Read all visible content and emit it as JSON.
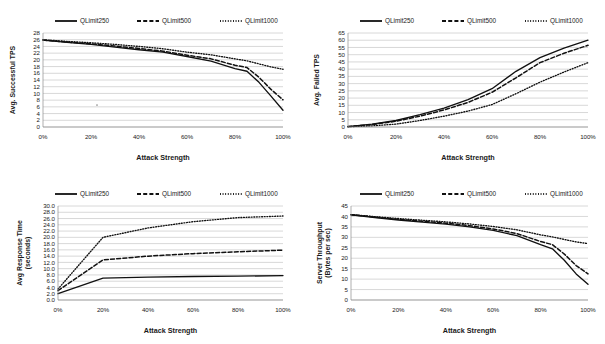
{
  "figure": {
    "top_text_fragment": "",
    "legend": {
      "entries": [
        {
          "label": "QLimit250",
          "style": "solid"
        },
        {
          "label": "QLimit500",
          "style": "dashed"
        },
        {
          "label": "QLimit1000",
          "style": "dotted"
        }
      ]
    },
    "shared_xlabel": "Attack Strength",
    "shared_xticks": [
      "0%",
      "20%",
      "40%",
      "60%",
      "80%",
      "100%"
    ]
  },
  "chart_data": [
    {
      "id": "avg-successful-tps",
      "position": "top-left",
      "type": "line",
      "title": "",
      "xlabel": "Attack Strength",
      "ylabel": "Avg. Successful TPS",
      "x": [
        0,
        10,
        20,
        30,
        40,
        50,
        60,
        70,
        80,
        85,
        90,
        95,
        100
      ],
      "xticks": [
        "0%",
        "20%",
        "40%",
        "60%",
        "80%",
        "100%"
      ],
      "xtick_values": [
        0,
        20,
        40,
        60,
        80,
        100
      ],
      "xlim": [
        0,
        100
      ],
      "ylim": [
        0,
        28
      ],
      "yticks": [
        0,
        2,
        4,
        6,
        8,
        10,
        12,
        14,
        16,
        18,
        20,
        22,
        24,
        26,
        28
      ],
      "ytick_labels": [
        "0",
        "2",
        "4",
        "6",
        "8",
        "10",
        "12",
        "14",
        "16",
        "18",
        "20",
        "22",
        "24",
        "26",
        "28"
      ],
      "grid": true,
      "legend_position": "top-center",
      "series": [
        {
          "name": "QLimit250",
          "style": "solid",
          "values": [
            25.9,
            25.2,
            24.6,
            23.8,
            23.0,
            22.3,
            21.0,
            19.6,
            17.4,
            16.6,
            13.3,
            9.2,
            5.0
          ]
        },
        {
          "name": "QLimit500",
          "style": "dashed",
          "values": [
            25.9,
            25.3,
            24.8,
            24.1,
            23.4,
            22.6,
            21.4,
            20.3,
            18.4,
            17.7,
            14.8,
            11.2,
            8.1
          ]
        },
        {
          "name": "QLimit1000",
          "style": "dotted",
          "values": [
            26.0,
            25.5,
            25.1,
            24.6,
            24.0,
            23.3,
            22.3,
            21.5,
            20.3,
            19.7,
            18.8,
            17.9,
            17.2
          ]
        }
      ]
    },
    {
      "id": "avg-failed-tps",
      "position": "top-right",
      "type": "line",
      "title": "",
      "xlabel": "Attack Strength",
      "ylabel": "Avg. Failed TPS",
      "x": [
        0,
        10,
        20,
        30,
        40,
        50,
        60,
        70,
        80,
        90,
        100
      ],
      "xticks": [
        "0%",
        "20%",
        "40%",
        "60%",
        "80%",
        "100%"
      ],
      "xtick_values": [
        0,
        20,
        40,
        60,
        80,
        100
      ],
      "xlim": [
        0,
        100
      ],
      "ylim": [
        0,
        65
      ],
      "yticks": [
        0,
        5,
        10,
        15,
        20,
        25,
        30,
        35,
        40,
        45,
        50,
        55,
        60,
        65
      ],
      "ytick_labels": [
        "0",
        "5",
        "10",
        "15",
        "20",
        "25",
        "30",
        "35",
        "40",
        "45",
        "50",
        "55",
        "60",
        "65"
      ],
      "grid": true,
      "legend_position": "top-center",
      "series": [
        {
          "name": "QLimit250",
          "style": "solid",
          "values": [
            0.3,
            2.0,
            4.5,
            8.5,
            13.0,
            19.0,
            26.5,
            38.5,
            48.0,
            54.5,
            60.0
          ]
        },
        {
          "name": "QLimit500",
          "style": "dashed",
          "values": [
            0.3,
            1.7,
            4.0,
            7.5,
            11.8,
            17.0,
            24.0,
            34.0,
            44.5,
            51.0,
            56.5
          ]
        },
        {
          "name": "QLimit1000",
          "style": "dotted",
          "values": [
            0.2,
            0.8,
            2.0,
            4.5,
            7.5,
            11.0,
            15.5,
            23.0,
            31.0,
            38.0,
            44.5
          ]
        }
      ]
    },
    {
      "id": "avg-response-time",
      "position": "bottom-left",
      "type": "line",
      "title": "",
      "xlabel": "Attack Strength",
      "ylabel": "Avg Response Time (seconds)",
      "ylabel_line1": "Avg Response Time",
      "ylabel_line2": "(seconds)",
      "x": [
        0,
        20,
        40,
        60,
        80,
        100
      ],
      "xticks": [
        "0%",
        "20%",
        "40%",
        "60%",
        "80%",
        "100%"
      ],
      "xtick_values": [
        0,
        20,
        40,
        60,
        80,
        100
      ],
      "xlim": [
        0,
        100
      ],
      "ylim": [
        0,
        30
      ],
      "yticks": [
        0,
        2,
        4,
        6,
        8,
        10,
        12,
        14,
        16,
        18,
        20,
        22,
        24,
        26,
        28,
        30
      ],
      "ytick_labels": [
        "0.0",
        "2.0",
        "4.0",
        "6.0",
        "8.0",
        "10.0",
        "12.0",
        "14.0",
        "16.0",
        "18.0",
        "20.0",
        "22.0",
        "24.0",
        "26.0",
        "28.0",
        "30.0"
      ],
      "grid": true,
      "legend_position": "top-center",
      "series": [
        {
          "name": "QLimit250",
          "style": "solid",
          "values": [
            2.0,
            7.0,
            7.3,
            7.5,
            7.6,
            7.8
          ]
        },
        {
          "name": "QLimit500",
          "style": "dashed",
          "values": [
            3.0,
            12.8,
            14.0,
            14.8,
            15.4,
            15.9
          ]
        },
        {
          "name": "QLimit1000",
          "style": "dotted",
          "values": [
            3.5,
            20.0,
            23.0,
            25.0,
            26.3,
            26.8
          ]
        }
      ]
    },
    {
      "id": "server-throughput",
      "position": "bottom-right",
      "type": "line",
      "title": "",
      "xlabel": "Attack Strength",
      "ylabel": "Server Throughput (Bytes per sec)",
      "ylabel_line1": "Server Throughput",
      "ylabel_line2": "(Bytes per sec)",
      "x": [
        0,
        10,
        20,
        30,
        40,
        50,
        60,
        70,
        80,
        85,
        90,
        95,
        100
      ],
      "xticks": [
        "0%",
        "20%",
        "40%",
        "60%",
        "80%",
        "100%"
      ],
      "xtick_values": [
        0,
        20,
        40,
        60,
        80,
        100
      ],
      "xlim": [
        0,
        45
      ],
      "ylim": [
        0,
        45
      ],
      "yticks": [
        0,
        5,
        10,
        15,
        20,
        25,
        30,
        35,
        40,
        45
      ],
      "ytick_labels": [
        "0",
        "5",
        "10",
        "15",
        "20",
        "25",
        "30",
        "35",
        "40",
        "45"
      ],
      "grid": true,
      "legend_position": "top-center",
      "series": [
        {
          "name": "QLimit250",
          "style": "solid",
          "values": [
            40.8,
            39.5,
            38.3,
            37.3,
            36.3,
            35.0,
            33.3,
            30.8,
            26.5,
            24.5,
            19.0,
            12.5,
            7.5
          ]
        },
        {
          "name": "QLimit500",
          "style": "dashed",
          "values": [
            40.8,
            39.7,
            38.6,
            37.7,
            36.8,
            35.6,
            34.0,
            31.8,
            28.0,
            26.5,
            22.0,
            16.5,
            12.5
          ]
        },
        {
          "name": "QLimit1000",
          "style": "dotted",
          "values": [
            40.9,
            39.9,
            39.0,
            38.2,
            37.4,
            36.4,
            35.2,
            33.6,
            31.2,
            30.2,
            29.0,
            27.8,
            27.0
          ]
        }
      ]
    }
  ]
}
